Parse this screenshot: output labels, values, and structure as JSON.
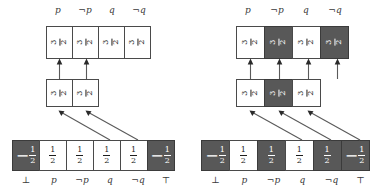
{
  "figure": {
    "type": "two-panel-logic-box-diagram",
    "panel_count": 2,
    "colors": {
      "box_border": "#4a4a4a",
      "box_light_fill": "#ffffff",
      "box_dark_fill": "#585858",
      "arrow": "#5a5a5a",
      "text": "#1d1d1d",
      "label_text": "#3a3a3a"
    }
  },
  "left": {
    "top_labels": [
      "p",
      "¬p",
      "q",
      "¬q"
    ],
    "bottom_labels": [
      "⊥",
      "p",
      "¬p",
      "q",
      "¬q",
      "⊤"
    ],
    "top_row": {
      "count": 4,
      "cells": [
        {
          "numerator": "3",
          "denominator": "2",
          "sign": "",
          "fill": "light",
          "rotated": true
        },
        {
          "numerator": "3",
          "denominator": "2",
          "sign": "",
          "fill": "light",
          "rotated": true
        },
        {
          "numerator": "3",
          "denominator": "2",
          "sign": "",
          "fill": "light",
          "rotated": true
        },
        {
          "numerator": "3",
          "denominator": "2",
          "sign": "",
          "fill": "light",
          "rotated": true
        }
      ]
    },
    "middle_row": {
      "count": 2,
      "cells": [
        {
          "numerator": "3",
          "denominator": "2",
          "sign": "",
          "fill": "light",
          "rotated": true
        },
        {
          "numerator": "3",
          "denominator": "2",
          "sign": "",
          "fill": "light",
          "rotated": true
        }
      ]
    },
    "bottom_row": {
      "count": 6,
      "cells": [
        {
          "numerator": "1",
          "denominator": "2",
          "sign": "−",
          "fill": "dark",
          "rotated": false
        },
        {
          "numerator": "1",
          "denominator": "2",
          "sign": "",
          "fill": "light",
          "rotated": false
        },
        {
          "numerator": "1",
          "denominator": "2",
          "sign": "",
          "fill": "light",
          "rotated": false
        },
        {
          "numerator": "1",
          "denominator": "2",
          "sign": "",
          "fill": "light",
          "rotated": false
        },
        {
          "numerator": "1",
          "denominator": "2",
          "sign": "",
          "fill": "light",
          "rotated": false
        },
        {
          "numerator": "1",
          "denominator": "2",
          "sign": "−",
          "fill": "dark",
          "rotated": false
        }
      ]
    }
  },
  "right": {
    "top_labels": [
      "p",
      "¬p",
      "q",
      "¬q"
    ],
    "bottom_labels": [
      "⊥",
      "p",
      "¬p",
      "q",
      "¬q",
      "⊤"
    ],
    "top_row": {
      "count": 4,
      "cells": [
        {
          "numerator": "3",
          "denominator": "2",
          "sign": "",
          "fill": "light",
          "rotated": true
        },
        {
          "numerator": "3",
          "denominator": "2",
          "sign": "",
          "fill": "dark",
          "rotated": true
        },
        {
          "numerator": "3",
          "denominator": "2",
          "sign": "",
          "fill": "light",
          "rotated": true
        },
        {
          "numerator": "3",
          "denominator": "2",
          "sign": "",
          "fill": "dark",
          "rotated": true
        }
      ]
    },
    "middle_row": {
      "count": 3,
      "cells": [
        {
          "numerator": "3",
          "denominator": "2",
          "sign": "",
          "fill": "light",
          "rotated": true
        },
        {
          "numerator": "3",
          "denominator": "2",
          "sign": "",
          "fill": "dark",
          "rotated": true
        },
        {
          "numerator": "3",
          "denominator": "2",
          "sign": "",
          "fill": "light",
          "rotated": true
        }
      ]
    },
    "bottom_row": {
      "count": 6,
      "cells": [
        {
          "numerator": "1",
          "denominator": "2",
          "sign": "−",
          "fill": "dark",
          "rotated": false
        },
        {
          "numerator": "1",
          "denominator": "2",
          "sign": "",
          "fill": "light",
          "rotated": false
        },
        {
          "numerator": "1",
          "denominator": "2",
          "sign": "",
          "fill": "dark",
          "rotated": false
        },
        {
          "numerator": "1",
          "denominator": "2",
          "sign": "",
          "fill": "light",
          "rotated": false
        },
        {
          "numerator": "1",
          "denominator": "2",
          "sign": "",
          "fill": "dark",
          "rotated": false
        },
        {
          "numerator": "1",
          "denominator": "2",
          "sign": "−",
          "fill": "dark",
          "rotated": false
        }
      ]
    }
  }
}
